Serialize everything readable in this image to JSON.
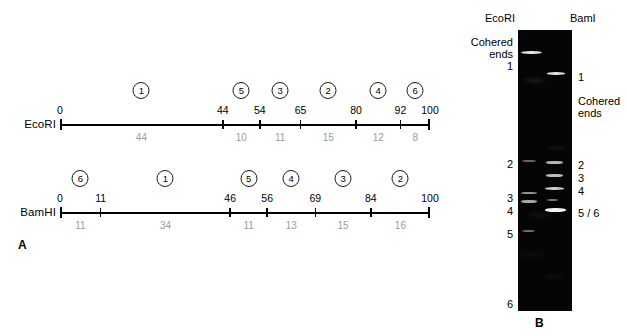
{
  "figure": {
    "panel_a_letter": "A",
    "panel_b_letter": "B"
  },
  "maps": [
    {
      "enzyme": "EcoRI",
      "axis_y": 125,
      "coords": [
        0,
        44,
        54,
        65,
        80,
        92,
        100
      ],
      "fragments": [
        {
          "label": "1",
          "size": "44",
          "start": 0,
          "end": 44
        },
        {
          "label": "5",
          "size": "10",
          "start": 44,
          "end": 54
        },
        {
          "label": "3",
          "size": "11",
          "start": 54,
          "end": 65
        },
        {
          "label": "2",
          "size": "15",
          "start": 65,
          "end": 80
        },
        {
          "label": "4",
          "size": "12",
          "start": 80,
          "end": 92
        },
        {
          "label": "6",
          "size": "8",
          "start": 92,
          "end": 100
        }
      ]
    },
    {
      "enzyme": "BamHI",
      "axis_y": 213,
      "coords": [
        0,
        11,
        46,
        56,
        69,
        84,
        100
      ],
      "fragments": [
        {
          "label": "6",
          "size": "11",
          "start": 0,
          "end": 11
        },
        {
          "label": "1",
          "size": "34",
          "start": 11,
          "end": 46
        },
        {
          "label": "5",
          "size": "11",
          "start": 46,
          "end": 56
        },
        {
          "label": "4",
          "size": "13",
          "start": 56,
          "end": 69
        },
        {
          "label": "3",
          "size": "15",
          "start": 69,
          "end": 84
        },
        {
          "label": "2",
          "size": "16",
          "start": 84,
          "end": 100
        }
      ]
    }
  ],
  "gel": {
    "columns": [
      {
        "name": "EcoRI",
        "x": 485
      },
      {
        "name": "BamI",
        "x": 570
      }
    ],
    "left_labels": [
      {
        "text": "Cohered",
        "y": 36
      },
      {
        "text": "ends",
        "y": 48
      },
      {
        "text": "1",
        "y": 60
      },
      {
        "text": "2",
        "y": 158
      },
      {
        "text": "3",
        "y": 192
      },
      {
        "text": "4",
        "y": 205
      },
      {
        "text": "5",
        "y": 228
      },
      {
        "text": "6",
        "y": 298
      }
    ],
    "right_labels": [
      {
        "text": "1",
        "y": 71
      },
      {
        "text": "Cohered",
        "y": 95
      },
      {
        "text": "ends",
        "y": 107
      },
      {
        "text": "2",
        "y": 159
      },
      {
        "text": "3",
        "y": 172
      },
      {
        "text": "4",
        "y": 185
      },
      {
        "text": "5 / 6",
        "y": 207
      }
    ],
    "bands": [
      {
        "lane": "EcoRI",
        "y": 51,
        "x": 521,
        "w": 21,
        "h": 3.4,
        "opacity": 0.95
      },
      {
        "lane": "EcoRI",
        "y": 160,
        "x": 522,
        "w": 14,
        "h": 2.0,
        "opacity": 0.42
      },
      {
        "lane": "EcoRI",
        "y": 192,
        "x": 521,
        "w": 16,
        "h": 2.4,
        "opacity": 0.62
      },
      {
        "lane": "EcoRI",
        "y": 200,
        "x": 521,
        "w": 16,
        "h": 2.6,
        "opacity": 0.7
      },
      {
        "lane": "EcoRI",
        "y": 230,
        "x": 522,
        "w": 13,
        "h": 2.0,
        "opacity": 0.45
      },
      {
        "lane": "BamI",
        "y": 72,
        "x": 547,
        "w": 18,
        "h": 3.0,
        "opacity": 0.92
      },
      {
        "lane": "BamI",
        "y": 161,
        "x": 546,
        "w": 17,
        "h": 2.6,
        "opacity": 0.75
      },
      {
        "lane": "BamI",
        "y": 174,
        "x": 546,
        "w": 17,
        "h": 2.6,
        "opacity": 0.78
      },
      {
        "lane": "BamI",
        "y": 187,
        "x": 545,
        "w": 19,
        "h": 3.0,
        "opacity": 0.85
      },
      {
        "lane": "BamI",
        "y": 199,
        "x": 547,
        "w": 11,
        "h": 2.0,
        "opacity": 0.5
      },
      {
        "lane": "BamI",
        "y": 208,
        "x": 545,
        "w": 21,
        "h": 4.0,
        "opacity": 1.0
      }
    ]
  },
  "geometry": {
    "axis_x0": 60,
    "axis_x100": 430,
    "gel_left": 518,
    "gel_top": 30,
    "gel_width": 54,
    "gel_height": 281,
    "panel_a_letter_x": 18,
    "panel_a_letter_y": 238,
    "panel_b_letter_x": 535,
    "panel_b_letter_y": 316
  }
}
